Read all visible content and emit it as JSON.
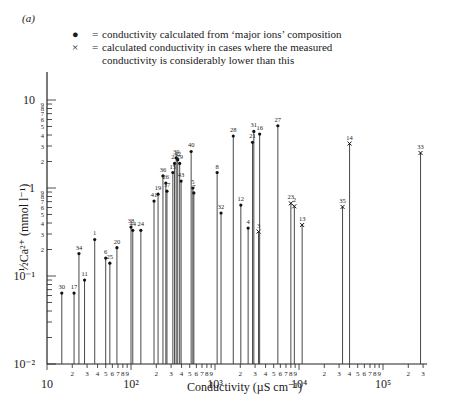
{
  "panel_label": "(a)",
  "legend": {
    "dot_symbol": "●",
    "dot_text": "conductivity calculated from ‘major ions’ composition",
    "cross_symbol": "×",
    "cross_text_1": "calculated conductivity in cases where the measured",
    "cross_text_2": "conductivity is considerably lower than this",
    "equals": "="
  },
  "axes": {
    "ylabel": "½Ca²⁺ (mmol l⁻¹)",
    "xlabel": "Conductivity (µS cm⁻¹)",
    "y_major_ticks": [
      {
        "value": 10,
        "label": "10"
      },
      {
        "value": 1,
        "label": "1"
      },
      {
        "value": 0.1,
        "label": "10⁻¹"
      },
      {
        "value": 0.01,
        "label": "10⁻²"
      }
    ],
    "x_major_ticks": [
      {
        "value": 10,
        "label": "10"
      },
      {
        "value": 100,
        "label": "10²"
      },
      {
        "value": 1000,
        "label": "10³"
      },
      {
        "value": 10000,
        "label": "10⁴"
      },
      {
        "value": 100000,
        "label": "10⁵"
      }
    ]
  },
  "chart_data": {
    "type": "scatter",
    "title": "",
    "xlabel": "Conductivity (µS cm⁻¹)",
    "ylabel": "½Ca²⁺ (mmol l⁻¹)",
    "xscale": "log",
    "yscale": "log",
    "xlim": [
      10,
      300000
    ],
    "ylim": [
      0.01,
      30
    ],
    "grid": false,
    "style": "drop-lines from x-axis to each point",
    "legend": [
      {
        "marker": "dot",
        "label": "conductivity calculated from ‘major ions’ composition"
      },
      {
        "marker": "cross",
        "label": "calculated conductivity in cases where the measured conductivity is considerably lower than this"
      }
    ],
    "points": [
      {
        "id": "30",
        "x": 15,
        "y": 0.064,
        "marker": "dot"
      },
      {
        "id": "17",
        "x": 21,
        "y": 0.064,
        "marker": "dot"
      },
      {
        "id": "34",
        "x": 24,
        "y": 0.18,
        "marker": "dot"
      },
      {
        "id": "11",
        "x": 28,
        "y": 0.09,
        "marker": "dot"
      },
      {
        "id": "1",
        "x": 37,
        "y": 0.26,
        "marker": "dot"
      },
      {
        "id": "6",
        "x": 50,
        "y": 0.16,
        "marker": "dot"
      },
      {
        "id": "25",
        "x": 56,
        "y": 0.14,
        "marker": "dot"
      },
      {
        "id": "20",
        "x": 68,
        "y": 0.21,
        "marker": "dot"
      },
      {
        "id": "38",
        "x": 100,
        "y": 0.36,
        "marker": "dot"
      },
      {
        "id": "44",
        "x": 105,
        "y": 0.33,
        "marker": "dot"
      },
      {
        "id": "24",
        "x": 131,
        "y": 0.33,
        "marker": "dot"
      },
      {
        "id": "41",
        "x": 188,
        "y": 0.71,
        "marker": "dot"
      },
      {
        "id": "19",
        "x": 210,
        "y": 0.85,
        "marker": "dot"
      },
      {
        "id": "36",
        "x": 240,
        "y": 1.37,
        "marker": "dot"
      },
      {
        "id": "26",
        "x": 260,
        "y": 1.14,
        "marker": "dot"
      },
      {
        "id": "37",
        "x": 268,
        "y": 0.92,
        "marker": "dot"
      },
      {
        "id": "15",
        "x": 315,
        "y": 1.5,
        "marker": "dot"
      },
      {
        "id": "22",
        "x": 330,
        "y": 1.9,
        "marker": "dot"
      },
      {
        "id": "39",
        "x": 345,
        "y": 2.2,
        "marker": "dot"
      },
      {
        "id": "42",
        "x": 360,
        "y": 2.1,
        "marker": "dot"
      },
      {
        "id": "29",
        "x": 380,
        "y": 1.9,
        "marker": "dot"
      },
      {
        "id": "43",
        "x": 395,
        "y": 1.2,
        "marker": "dot"
      },
      {
        "id": "40",
        "x": 520,
        "y": 2.6,
        "marker": "dot"
      },
      {
        "id": "5",
        "x": 545,
        "y": 1.0,
        "marker": "dot"
      },
      {
        "id": "7",
        "x": 560,
        "y": 0.88,
        "marker": "dot"
      },
      {
        "id": "8",
        "x": 1060,
        "y": 1.5,
        "marker": "dot"
      },
      {
        "id": "32",
        "x": 1180,
        "y": 0.52,
        "marker": "dot"
      },
      {
        "id": "28",
        "x": 1650,
        "y": 3.9,
        "marker": "dot"
      },
      {
        "id": "12",
        "x": 2030,
        "y": 0.64,
        "marker": "dot"
      },
      {
        "id": "4",
        "x": 2480,
        "y": 0.35,
        "marker": "dot"
      },
      {
        "id": "21",
        "x": 2800,
        "y": 3.3,
        "marker": "dot"
      },
      {
        "id": "31",
        "x": 2900,
        "y": 4.4,
        "marker": "dot"
      },
      {
        "id": "3",
        "x": 3300,
        "y": 0.32,
        "marker": "cross"
      },
      {
        "id": "16",
        "x": 3400,
        "y": 4.1,
        "marker": "dot"
      },
      {
        "id": "27",
        "x": 5600,
        "y": 5.1,
        "marker": "dot"
      },
      {
        "id": "23",
        "x": 8000,
        "y": 0.67,
        "marker": "cross"
      },
      {
        "id": "2",
        "x": 8800,
        "y": 0.62,
        "marker": "cross"
      },
      {
        "id": "13",
        "x": 10900,
        "y": 0.38,
        "marker": "cross"
      },
      {
        "id": "35",
        "x": 33000,
        "y": 0.61,
        "marker": "cross"
      },
      {
        "id": "14",
        "x": 40000,
        "y": 3.2,
        "marker": "cross"
      },
      {
        "id": "33",
        "x": 280000,
        "y": 2.5,
        "marker": "cross"
      }
    ]
  }
}
